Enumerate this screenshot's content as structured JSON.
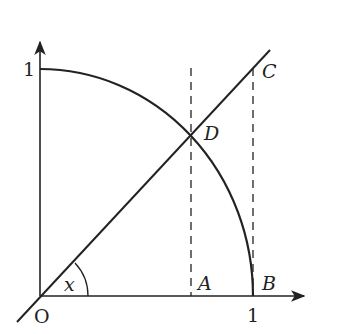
{
  "diagram": {
    "colors": {
      "stroke": "#222222",
      "background": "#ffffff"
    },
    "axes": {
      "origin_label": "O",
      "x_tick_label": "1",
      "y_tick_label": "1"
    },
    "points": {
      "A": "A",
      "B": "B",
      "C": "C",
      "D": "D"
    },
    "angle_label": "x"
  }
}
